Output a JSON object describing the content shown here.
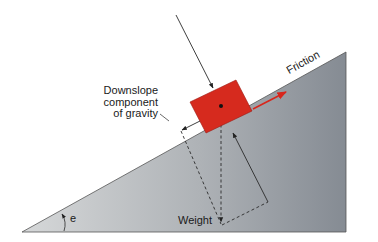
{
  "diagram": {
    "labels": {
      "downslope": [
        "Downslope",
        "component",
        "of gravity"
      ],
      "friction": "Friction",
      "weight": "Weight",
      "angle": "e"
    },
    "colors": {
      "block": "#d62a1e",
      "block_edge": "#9a1a12",
      "friction_arrow": "#d8261c",
      "incline_light": "#cfd1d2",
      "incline_dark": "#8a8f96",
      "line": "#2a2a2a",
      "background": "#ffffff"
    }
  }
}
